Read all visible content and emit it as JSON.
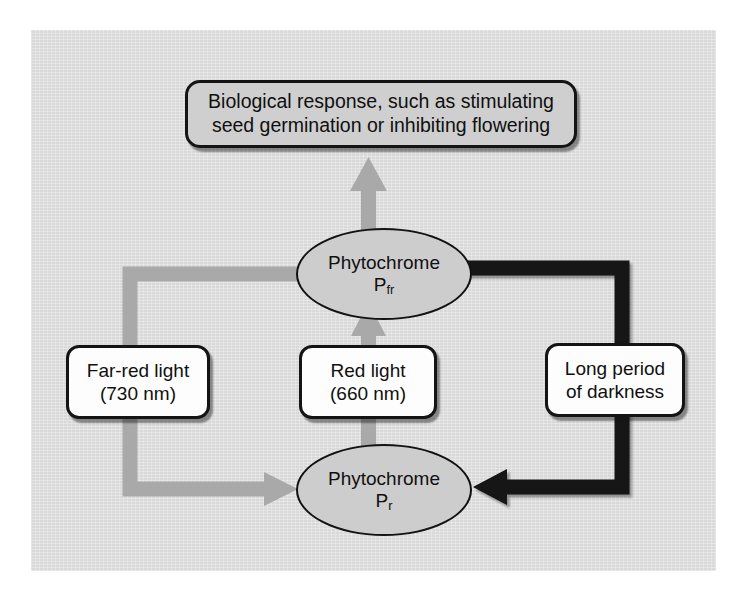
{
  "figure": {
    "background_color": "#d9d9d9",
    "page_color": "#ffffff"
  },
  "nodes": {
    "response": {
      "line1": "Biological response, such as stimulating",
      "line2": "seed germination or inhibiting flowering",
      "fill": "#cfcfcf"
    },
    "pfr": {
      "name_line": "Phytochrome",
      "symbol": "P",
      "subscript": "fr",
      "fill": "#cdcdcd"
    },
    "pr": {
      "name_line": "Phytochrome",
      "symbol": "P",
      "subscript": "r",
      "fill": "#cdcdcd"
    },
    "far_red": {
      "line1": "Far-red light",
      "line2": "(730 nm)",
      "fill": "#fdfdfd"
    },
    "red": {
      "line1": "Red light",
      "line2": "(660 nm)",
      "fill": "#fdfdfd"
    },
    "darkness": {
      "line1": "Long period",
      "line2": "of darkness",
      "fill": "#fdfdfd"
    }
  },
  "arrows": {
    "red_to_pfr": {
      "label": "Red light converts Pr to Pfr",
      "color": "#a9a9a9",
      "direction": "up"
    },
    "pfr_to_response": {
      "label": "Pfr triggers biological response",
      "color": "#a9a9a9",
      "direction": "up"
    },
    "far_red_to_pr": {
      "label": "Far-red light converts Pfr to Pr",
      "color": "#a9a9a9",
      "direction": "left-down-right"
    },
    "darkness_to_pr": {
      "label": "Long period of darkness converts Pfr to Pr",
      "color": "#121212",
      "direction": "right-down-left"
    }
  }
}
